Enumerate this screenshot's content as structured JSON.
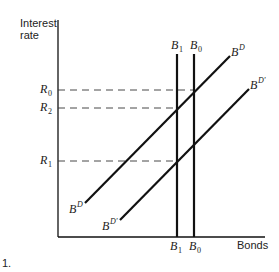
{
  "axes": {
    "y_label_line1": "Interest",
    "y_label_line2": "rate",
    "x_label": "Bonds"
  },
  "rate_levels": [
    {
      "base": "R",
      "sub": "0"
    },
    {
      "base": "R",
      "sub": "2"
    },
    {
      "base": "R",
      "sub": "1"
    }
  ],
  "supply_lines": [
    {
      "base": "B",
      "sub": "1"
    },
    {
      "base": "B",
      "sub": "0"
    }
  ],
  "demand_curves": [
    {
      "base": "B",
      "sup": "D"
    },
    {
      "base": "B",
      "sup": "D'"
    }
  ],
  "footnote": "1."
}
